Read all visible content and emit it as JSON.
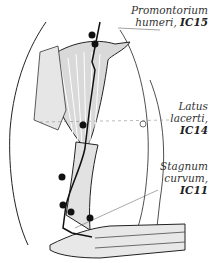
{
  "figure": {
    "points": [
      {
        "name": "Promontorium humeri",
        "code": "IC15",
        "line1": "Promontorium",
        "line2_name": "humeri,",
        "line2_code": "IC15"
      },
      {
        "name": "Latus lacerti",
        "code": "IC14",
        "line1": "Latus",
        "line2": "lacerti,",
        "line3": "IC14"
      },
      {
        "name": "Stagnum curvum",
        "code": "IC11",
        "line1": "Stagnum",
        "line2": "curvum,",
        "line3": "IC11"
      }
    ],
    "colors": {
      "line": "#1a1a1a",
      "shade": "#cfcfcf",
      "dot": "#111111",
      "text": "#333333"
    }
  }
}
